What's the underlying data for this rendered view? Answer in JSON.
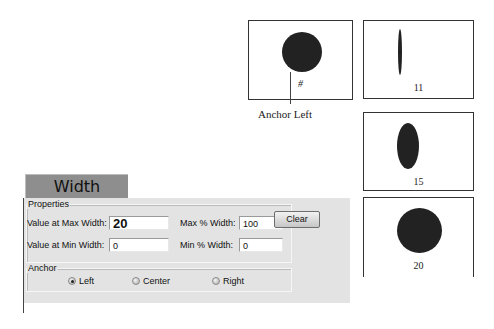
{
  "header": {
    "title": "Width"
  },
  "properties": {
    "group_label": "Properties",
    "value_at_max_width": {
      "label": "Value at Max Width:",
      "value": "20"
    },
    "value_at_min_width": {
      "label": "Value at Min Width:",
      "value": "0"
    },
    "max_pct_width": {
      "label": "Max % Width:",
      "value": "100"
    },
    "min_pct_width": {
      "label": "Min % Width:",
      "value": "0"
    },
    "clear_label": "Clear"
  },
  "anchor": {
    "group_label": "Anchor",
    "options": [
      {
        "label": "Left",
        "selected": true
      },
      {
        "label": "Center",
        "selected": false
      },
      {
        "label": "Right",
        "selected": false
      }
    ]
  },
  "preview": {
    "placeholder": "#",
    "caption": "Anchor Left"
  },
  "examples": [
    {
      "value": "11"
    },
    {
      "value": "15"
    },
    {
      "value": "20"
    }
  ]
}
